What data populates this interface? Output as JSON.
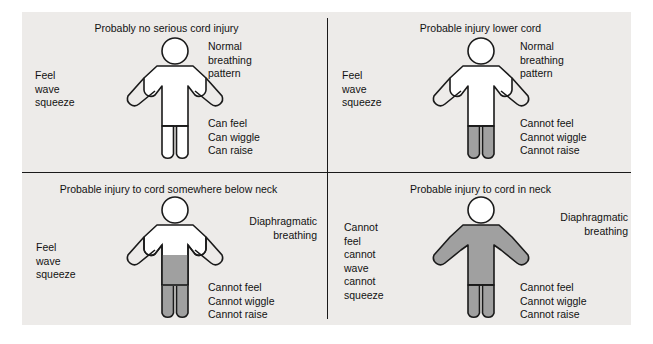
{
  "diagram": {
    "colors": {
      "panel_background": "#edebe9",
      "figure_outline": "#1a1a1a",
      "figure_white": "#ffffff",
      "figure_shaded": "#a0a0a0",
      "text": "#121212"
    },
    "quadrants": [
      {
        "id": "top-left",
        "title": "Probably no serious cord injury",
        "upper_right_note": "Normal\nbreathing\npattern",
        "left_note": "Feel\nwave\nsqueeze",
        "lower_right_note": "Can feel\nCan wiggle\nCan raise",
        "shading": "none"
      },
      {
        "id": "top-right",
        "title": "Probable injury lower cord",
        "upper_right_note": "Normal\nbreathing\npattern",
        "left_note": "Feel\nwave\nsqueeze",
        "lower_right_note": "Cannot feel\nCannot wiggle\nCannot raise",
        "shading": "legs"
      },
      {
        "id": "bottom-left",
        "title": "Probable injury to cord somewhere below neck",
        "upper_right_note": "Diaphragmatic\nbreathing",
        "left_note": "Feel\nwave\nsqueeze",
        "lower_right_note": "Cannot feel\nCannot wiggle\nCannot raise",
        "shading": "below-chest"
      },
      {
        "id": "bottom-right",
        "title": "Probable injury to cord in neck",
        "upper_right_note": "Diaphragmatic\nbreathing",
        "left_note": "Cannot\nfeel\ncannot\nwave\ncannot\nsqueeze",
        "lower_right_note": "Cannot feel\nCannot wiggle\nCannot raise",
        "shading": "body-all"
      }
    ]
  }
}
